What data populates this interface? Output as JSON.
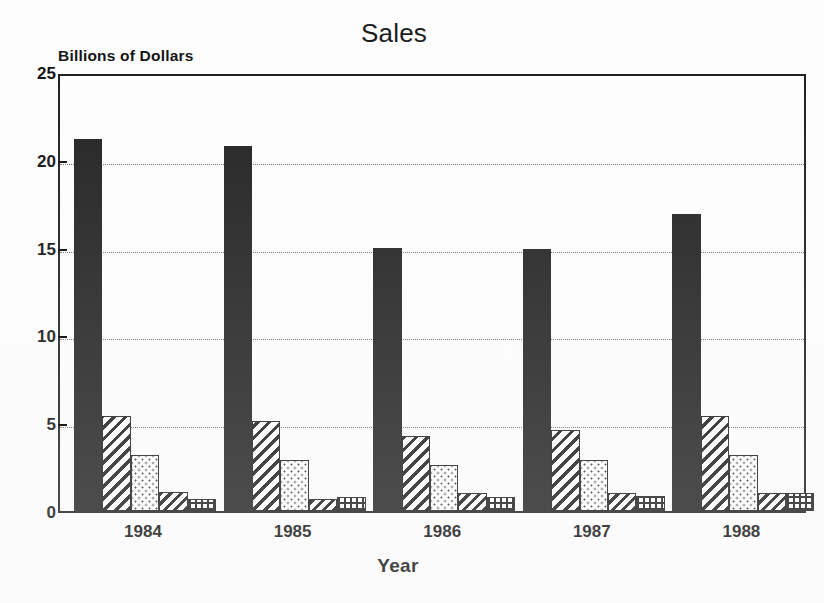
{
  "chart_data": {
    "type": "bar",
    "title": "Sales",
    "xlabel": "Year",
    "ylabel": "Billions of Dollars",
    "categories": [
      "1984",
      "1985",
      "1986",
      "1987",
      "1988"
    ],
    "ylim": [
      0,
      25
    ],
    "yticks": [
      0,
      5,
      10,
      15,
      20,
      25
    ],
    "ytick_labels": [
      "0",
      "5",
      "10",
      "15",
      "20",
      "25"
    ],
    "grid": true,
    "grid_axis": "y",
    "legend": "none",
    "series": [
      {
        "name": "Series 1",
        "pattern": "solid-black",
        "values": [
          21.2,
          20.8,
          15.0,
          14.9,
          16.9
        ]
      },
      {
        "name": "Series 2",
        "pattern": "diagonal-hatch",
        "values": [
          5.4,
          5.1,
          4.3,
          4.6,
          5.4
        ]
      },
      {
        "name": "Series 3",
        "pattern": "dotted-stipple",
        "values": [
          3.2,
          2.9,
          2.6,
          2.9,
          3.2
        ]
      },
      {
        "name": "Series 4",
        "pattern": "diagonal-hatch-fine",
        "values": [
          1.1,
          0.7,
          1.0,
          1.0,
          1.05
        ]
      },
      {
        "name": "Series 5",
        "pattern": "cross-grid",
        "values": [
          0.7,
          0.8,
          0.8,
          0.85,
          1.0
        ]
      }
    ]
  },
  "colors": {
    "axis": "#1b1b1b",
    "grid": "#6e6e6e",
    "bar_solid": "#201f1f",
    "background": "#fdfdfd",
    "text": "#0d0d0d"
  }
}
